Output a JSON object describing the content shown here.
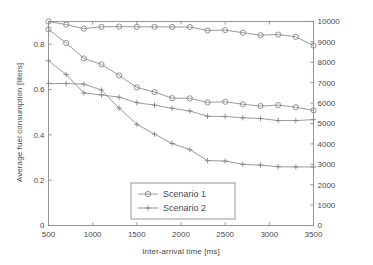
{
  "chart_data": {
    "type": "line",
    "title": "",
    "xlabel": "Inter-arrival time [ms]",
    "ylabel": "Average fuel consumption [liters]",
    "ylabel_right": "Average travel distance [meters]",
    "xlim": [
      500,
      3500
    ],
    "ylim": [
      0,
      0.9
    ],
    "ylim_right": [
      0,
      10000
    ],
    "xticks": [
      500,
      1000,
      1500,
      2000,
      2500,
      3000,
      3500
    ],
    "yticks": [
      0,
      0.2,
      0.4,
      0.6,
      0.8
    ],
    "yticks_right": [
      0,
      1000,
      2000,
      3000,
      4000,
      5000,
      6000,
      7000,
      8000,
      9000,
      10000
    ],
    "grid": false,
    "legend_position": "lower center",
    "x": [
      500,
      700,
      900,
      1100,
      1300,
      1500,
      1700,
      1900,
      2100,
      2300,
      2500,
      2700,
      2900,
      3100,
      3300,
      3500
    ],
    "series": [
      {
        "name": "Scenario 1",
        "axis": "right",
        "marker": "circle",
        "quantity": "Average travel distance [meters]",
        "values": [
          10000,
          9850,
          9650,
          9740,
          9750,
          9740,
          9740,
          9730,
          9730,
          9560,
          9580,
          9450,
          9330,
          9360,
          9250,
          8820
        ]
      },
      {
        "name": "Scenario 1",
        "axis": "left",
        "marker": "circle",
        "quantity": "Average fuel consumption [liters]",
        "values": [
          0.865,
          0.805,
          0.737,
          0.711,
          0.662,
          0.609,
          0.589,
          0.562,
          0.561,
          0.543,
          0.546,
          0.535,
          0.527,
          0.531,
          0.522,
          0.508
        ]
      },
      {
        "name": "Scenario 2",
        "axis": "left",
        "marker": "plus",
        "quantity": "Average fuel consumption [liters]",
        "values": [
          0.727,
          0.666,
          0.585,
          0.576,
          0.566,
          0.542,
          0.531,
          0.517,
          0.505,
          0.482,
          0.481,
          0.475,
          0.472,
          0.463,
          0.463,
          0.467
        ]
      },
      {
        "name": "Scenario 2",
        "axis": "right",
        "marker": "plus",
        "quantity": "Average travel distance [meters]",
        "values": [
          6960,
          6960,
          6930,
          6640,
          5750,
          4960,
          4480,
          4020,
          3720,
          3180,
          3160,
          3000,
          2960,
          2880,
          2870,
          2870
        ]
      }
    ],
    "legend": [
      {
        "label": "Scenario 1",
        "marker": "circle"
      },
      {
        "label": "Scenario 2",
        "marker": "plus"
      }
    ],
    "colors": {
      "line": "#808080",
      "marker": "#808080",
      "axis": "#8c8c8c",
      "text": "#4a4a4a",
      "background": "#ffffff"
    }
  }
}
